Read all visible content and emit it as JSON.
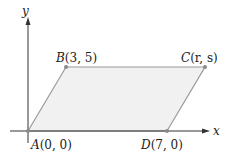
{
  "diagram": {
    "type": "parallelogram-on-axes",
    "axes": {
      "x_label": "x",
      "y_label": "y"
    },
    "points": [
      {
        "id": "A",
        "label": "A(0, 0)",
        "name": "A",
        "coords": "(0, 0)"
      },
      {
        "id": "B",
        "label": "B(3, 5)",
        "name": "B",
        "coords": "(3, 5)"
      },
      {
        "id": "C",
        "label": "C(r, s)",
        "name": "C",
        "coords": "(r, s)"
      },
      {
        "id": "D",
        "label": "D(7, 0)",
        "name": "D",
        "coords": "(7, 0)"
      }
    ],
    "colors": {
      "fill": "#f1f1f1",
      "edge": "#9a9a9a",
      "axis": "#333333",
      "point": "#8a8a8a"
    }
  }
}
